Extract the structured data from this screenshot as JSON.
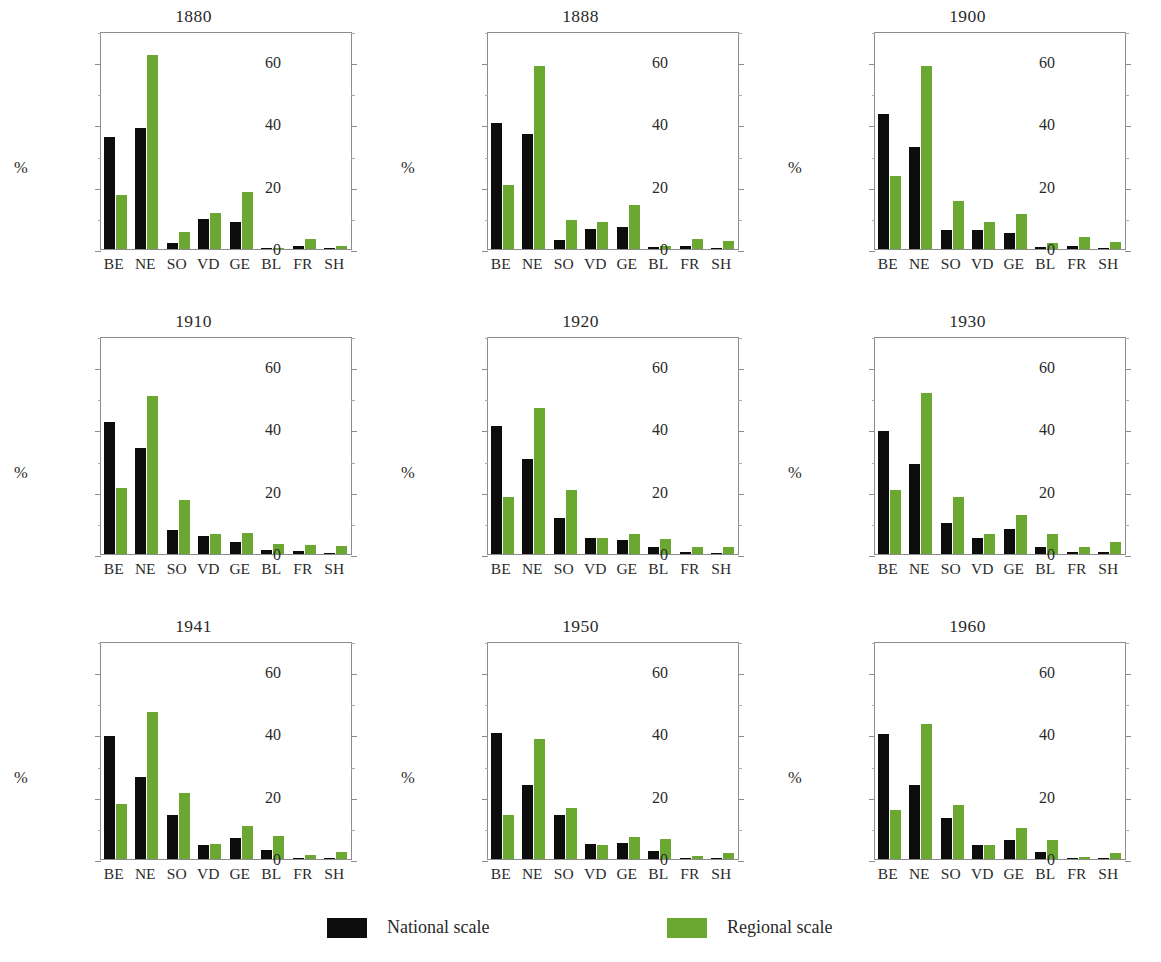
{
  "figure": {
    "ylabel": "%",
    "legend": {
      "items": [
        {
          "label": "National scale",
          "color": "#0d0d0d",
          "key": "national"
        },
        {
          "label": "Regional scale",
          "color": "#6aa832",
          "key": "regional"
        }
      ]
    }
  },
  "chart_data": {
    "type": "bar",
    "title": "",
    "xlabel": "",
    "ylabel": "%",
    "ylim": [
      0,
      70
    ],
    "yticks": [
      0,
      20,
      40,
      60
    ],
    "ytick_labels": [
      "0",
      "20",
      "40",
      "60"
    ],
    "grid": false,
    "legend_position": "bottom",
    "categories": [
      "BE",
      "NE",
      "SO",
      "VD",
      "GE",
      "BL",
      "FR",
      "SH"
    ],
    "series_names": [
      "National scale",
      "Regional scale"
    ],
    "series_colors": [
      "#0d0d0d",
      "#6aa832"
    ],
    "panels": [
      {
        "title": "1880",
        "series": [
          {
            "name": "National scale",
            "values": [
              36.0,
              38.7,
              2.0,
              9.6,
              8.6,
              0.3,
              1.0,
              0.2
            ]
          },
          {
            "name": "Regional scale",
            "values": [
              17.4,
              62.3,
              5.5,
              11.6,
              18.2,
              0.4,
              3.3,
              1.0
            ]
          }
        ]
      },
      {
        "title": "1888",
        "series": [
          {
            "name": "National scale",
            "values": [
              40.5,
              36.8,
              3.0,
              6.4,
              7.0,
              0.5,
              1.0,
              0.3
            ]
          },
          {
            "name": "Regional scale",
            "values": [
              20.7,
              58.8,
              9.2,
              8.8,
              14.1,
              1.0,
              3.2,
              2.7
            ]
          }
        ]
      },
      {
        "title": "1900",
        "series": [
          {
            "name": "National scale",
            "values": [
              43.2,
              32.8,
              6.0,
              6.0,
              5.1,
              0.5,
              1.0,
              0.2
            ]
          },
          {
            "name": "Regional scale",
            "values": [
              23.4,
              58.9,
              15.3,
              8.7,
              11.4,
              1.8,
              4.0,
              2.2
            ]
          }
        ]
      },
      {
        "title": "1910",
        "series": [
          {
            "name": "National scale",
            "values": [
              42.3,
              34.2,
              7.6,
              5.9,
              4.0,
              1.3,
              1.0,
              0.4
            ]
          },
          {
            "name": "Regional scale",
            "values": [
              21.3,
              50.8,
              17.2,
              6.5,
              6.6,
              3.2,
              3.0,
              2.5
            ]
          }
        ]
      },
      {
        "title": "1920",
        "series": [
          {
            "name": "National scale",
            "values": [
              41.0,
              30.6,
              11.6,
              5.2,
              4.6,
              2.1,
              0.7,
              0.3
            ]
          },
          {
            "name": "Regional scale",
            "values": [
              18.4,
              47.0,
              20.5,
              5.3,
              6.5,
              4.9,
              2.3,
              2.2
            ]
          }
        ]
      },
      {
        "title": "1930",
        "series": [
          {
            "name": "National scale",
            "values": [
              39.5,
              29.0,
              9.8,
              5.1,
              8.0,
              2.3,
              0.8,
              0.8
            ]
          },
          {
            "name": "Regional scale",
            "values": [
              20.7,
              51.8,
              18.4,
              6.3,
              12.4,
              6.5,
              2.2,
              3.7
            ]
          }
        ]
      },
      {
        "title": "1941",
        "series": [
          {
            "name": "National scale",
            "values": [
              39.5,
              26.3,
              14.2,
              4.4,
              6.8,
              2.8,
              0.3,
              0.4
            ]
          },
          {
            "name": "Regional scale",
            "values": [
              17.8,
              47.3,
              21.3,
              4.7,
              10.7,
              7.4,
              1.2,
              2.4
            ]
          }
        ]
      },
      {
        "title": "1950",
        "series": [
          {
            "name": "National scale",
            "values": [
              40.4,
              23.8,
              14.2,
              4.9,
              5.1,
              2.6,
              0.3,
              0.4
            ]
          },
          {
            "name": "Regional scale",
            "values": [
              14.0,
              38.5,
              16.3,
              4.4,
              7.0,
              6.4,
              0.9,
              1.9
            ]
          }
        ]
      },
      {
        "title": "1960",
        "series": [
          {
            "name": "National scale",
            "values": [
              40.2,
              23.9,
              13.3,
              4.6,
              6.2,
              2.2,
              0.3,
              0.4
            ]
          },
          {
            "name": "Regional scale",
            "values": [
              15.7,
              43.3,
              17.4,
              4.6,
              9.8,
              6.1,
              0.7,
              1.9
            ]
          }
        ]
      }
    ]
  }
}
